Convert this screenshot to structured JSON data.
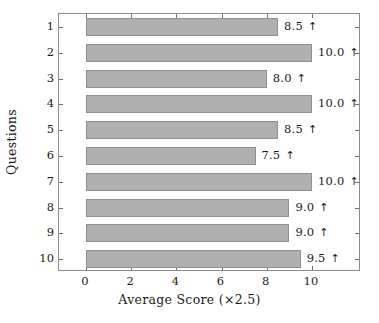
{
  "chart_data": {
    "type": "bar",
    "orientation": "horizontal",
    "title": "",
    "xlabel": "Average Score (×2.5)",
    "ylabel": "Questions",
    "categories": [
      "1",
      "2",
      "3",
      "4",
      "5",
      "6",
      "7",
      "8",
      "9",
      "10"
    ],
    "values": [
      8.5,
      10.0,
      8.0,
      10.0,
      8.5,
      7.5,
      10.0,
      9.0,
      9.0,
      9.5
    ],
    "data_labels": [
      "8.5",
      "10.0",
      "8.0",
      "10.0",
      "8.5",
      "7.5",
      "10.0",
      "9.0",
      "9.0",
      "9.5"
    ],
    "label_suffix_icon": "up-arrow",
    "label_suffix_glyph": "↑",
    "xlim": [
      -0.45,
      11.2
    ],
    "ylim": [
      0.5,
      10.5
    ],
    "xticks": [
      0,
      2,
      4,
      6,
      8,
      10
    ],
    "xtick_labels": [
      "0",
      "2",
      "4",
      "6",
      "8",
      "10"
    ],
    "ytick_labels": [
      "1",
      "2",
      "3",
      "4",
      "5",
      "6",
      "7",
      "8",
      "9",
      "10"
    ],
    "grid": false,
    "legend": null,
    "bar_color": "#b0b0b0",
    "bar_edge_color": "#8f8f8f",
    "frame_color": "#8c8c8c",
    "tick_color": "#6e6e6e",
    "background": "#ffffff",
    "text_color": "#1a1a1a"
  }
}
